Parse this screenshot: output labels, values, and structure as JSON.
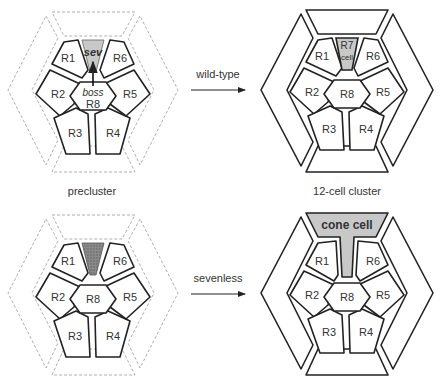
{
  "panels": {
    "top_left": {
      "cells": [
        "R1",
        "R2",
        "R3",
        "R4",
        "R5",
        "R6",
        "R8"
      ],
      "sev_label": "sev",
      "boss_label": "boss",
      "caption": "precluster"
    },
    "top_right": {
      "cells": [
        "R1",
        "R2",
        "R3",
        "R4",
        "R5",
        "R6",
        "R8"
      ],
      "r7_line1": "R7",
      "r7_line2": "cell",
      "caption": "12-cell cluster"
    },
    "bottom_left": {
      "cells": [
        "R1",
        "R2",
        "R3",
        "R4",
        "R5",
        "R6",
        "R8"
      ]
    },
    "bottom_right": {
      "cells": [
        "R1",
        "R2",
        "R3",
        "R4",
        "R5",
        "R6",
        "R8"
      ],
      "cone_label": "cone cell"
    }
  },
  "arrows": {
    "top": "wild-type",
    "bottom": "sevenless"
  },
  "colors": {
    "outline": "#222222",
    "dashed": "#9a9a9a",
    "shade": "#c8c8c8",
    "dark_shade": "#7a7a7a"
  }
}
